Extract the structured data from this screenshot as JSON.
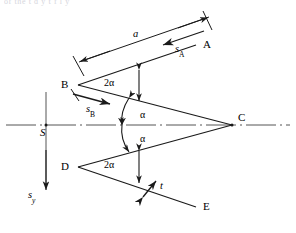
{
  "figure": {
    "title_fragment": "of the  t  d  y  t   f    l  y",
    "stroke_color": "#1a1a1a",
    "axis_color": "#555555",
    "background": "#ffffff"
  },
  "points": {
    "A": "A",
    "B": "B",
    "C": "C",
    "D": "D",
    "E": "E",
    "S": "S"
  },
  "angles": {
    "top_2alpha": "2α",
    "bottom_2alpha": "2α",
    "upper_alpha": "α",
    "lower_alpha": "α"
  },
  "dimensions": {
    "length_a": "a",
    "thickness_t": "t"
  },
  "vectors": {
    "sA_base": "s",
    "sA_sub": "A",
    "sB_base": "s",
    "sB_sub": "B",
    "sy_base": "s",
    "sy_sub": "y"
  }
}
